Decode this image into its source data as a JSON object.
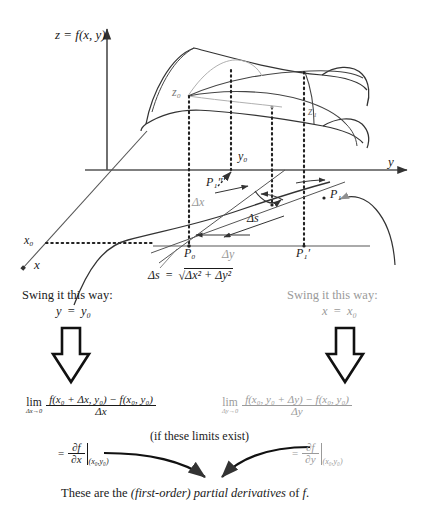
{
  "figure": {
    "type": "math-diagram",
    "topic": "first-order partial derivatives",
    "axes": {
      "z_label": "z = f(x, y)",
      "y_label": "y",
      "x_label": "x"
    },
    "surface": {
      "z0_label": "z₀",
      "z1_label": "z₁",
      "y0_label": "y₀",
      "x0_label": "x₀"
    },
    "base_plane": {
      "P0": "P₀",
      "P1": "P₁",
      "P1_prime": "P₁′",
      "P1_dprime": "P₁″",
      "delta_x": "Δx",
      "delta_y": "Δy",
      "delta_s": "Δs",
      "arc_formula_lhs": "Δs",
      "arc_formula_eq": "=",
      "arc_formula_radicand": "Δx² + Δy²"
    },
    "swing_left": {
      "line1": "Swing it this way:",
      "line2_lhs": "y",
      "line2_eq": "=",
      "line2_rhs": "y₀"
    },
    "swing_right": {
      "line1": "Swing it this way:",
      "line2_lhs": "x",
      "line2_eq": "=",
      "line2_rhs": "x₀",
      "color": "#9a9a9a"
    },
    "limit_left": {
      "lim_op": "lim",
      "lim_sub": "Δx→0",
      "numerator": "f(x₀ + Δx, y₀) − f(x₀, y₀)",
      "denominator": "Δx"
    },
    "limit_right": {
      "lim_op": "lim",
      "lim_sub": "Δy→0",
      "numerator": "f(x₀, y₀ + Δy) − f(x₀, y₀)",
      "denominator": "Δy",
      "color": "#9a9a9a"
    },
    "caveat": "(if these limits exist)",
    "result_left": {
      "eq": "=",
      "numerator": "∂f",
      "denominator": "∂x",
      "eval_at": "(x₀,y₀)"
    },
    "result_right": {
      "eq": "=",
      "numerator": "∂f",
      "denominator": "∂y",
      "eval_at": "(x₀,y₀)",
      "color": "#9a9a9a"
    },
    "conclusion": {
      "part1": "These are the ",
      "emph": "(first-order) partial derivatives",
      "part2": " of ",
      "emph2": "f",
      "part3": "."
    },
    "colors": {
      "ink": "#1a1a1a",
      "gray": "#9a9a9a",
      "light_gray": "#b4b4b4",
      "background": "#ffffff"
    }
  }
}
